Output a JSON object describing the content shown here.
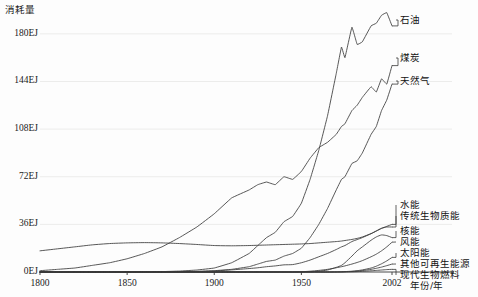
{
  "chart_data": {
    "type": "line",
    "title": "",
    "ylabel": "消耗量",
    "xlabel": "年份/年",
    "x_unit_note": "年份/年",
    "grid": true,
    "grid_axis": "y",
    "legend_position": "right-inline-leader-lines",
    "xlim": [
      1800,
      2002
    ],
    "ylim": [
      0,
      198
    ],
    "yticks": [
      0,
      36,
      72,
      108,
      144,
      180
    ],
    "ytick_labels": [
      "0EJ",
      "36EJ",
      "72EJ",
      "108EJ",
      "144EJ",
      "180EJ"
    ],
    "xticks": [
      1800,
      1850,
      1900,
      1950,
      2002
    ],
    "xtick_labels": [
      "1800",
      "1850",
      "1900",
      "1950",
      "2002"
    ],
    "x": [
      1800,
      1810,
      1820,
      1830,
      1840,
      1850,
      1860,
      1870,
      1880,
      1890,
      1900,
      1910,
      1920,
      1925,
      1930,
      1935,
      1940,
      1945,
      1950,
      1955,
      1960,
      1965,
      1970,
      1973,
      1975,
      1979,
      1982,
      1985,
      1990,
      1993,
      1996,
      1999,
      2002
    ],
    "series": [
      {
        "name": "石油",
        "name_en": "oil",
        "label_anchor_year": 2002,
        "label_anchor_value": 186,
        "values": [
          0,
          0,
          0,
          0,
          0,
          0,
          0.1,
          0.3,
          0.7,
          1.5,
          3,
          7,
          14,
          20,
          26,
          30,
          38,
          42,
          52,
          70,
          92,
          118,
          150,
          170,
          162,
          185,
          172,
          174,
          186,
          188,
          194,
          196,
          186
        ]
      },
      {
        "name": "煤炭",
        "name_en": "coal",
        "label_anchor_year": 2002,
        "label_anchor_value": 156,
        "values": [
          1,
          2,
          3,
          5,
          7,
          10,
          14,
          19,
          26,
          34,
          44,
          56,
          62,
          66,
          68,
          66,
          72,
          70,
          76,
          86,
          94,
          98,
          104,
          110,
          112,
          122,
          126,
          132,
          140,
          136,
          146,
          142,
          156
        ]
      },
      {
        "name": "天然气",
        "name_en": "natural gas",
        "label_anchor_year": 2002,
        "label_anchor_value": 142,
        "values": [
          0,
          0,
          0,
          0,
          0,
          0,
          0,
          0,
          0.2,
          0.5,
          1,
          2,
          4,
          6,
          8,
          9,
          12,
          14,
          18,
          26,
          36,
          48,
          62,
          70,
          72,
          82,
          84,
          90,
          104,
          110,
          122,
          130,
          142
        ]
      },
      {
        "name": "水能",
        "name_en": "hydropower",
        "label_anchor_year": 2002,
        "label_anchor_value": 36,
        "values": [
          0,
          0,
          0,
          0,
          0,
          0,
          0,
          0,
          0.1,
          0.3,
          0.8,
          1.6,
          2.6,
          3.2,
          4,
          4.6,
          5.4,
          5.6,
          7,
          9,
          11.5,
          14,
          17,
          19,
          20,
          23,
          24.5,
          26,
          29,
          31,
          33,
          34.5,
          36
        ]
      },
      {
        "name": "传统生物质能",
        "name_en": "traditional biomass",
        "label_anchor_year": 2002,
        "label_anchor_value": 34,
        "values": [
          16,
          17.5,
          19,
          20.5,
          21.5,
          22,
          22.2,
          22,
          21.5,
          20.8,
          20,
          19.8,
          20,
          20.2,
          20.4,
          20.6,
          20.8,
          21,
          21.2,
          21.5,
          22,
          22.5,
          23,
          23.4,
          23.8,
          24.6,
          25.4,
          26.5,
          29,
          31,
          33,
          34,
          34
        ]
      },
      {
        "name": "核能",
        "name_en": "nuclear",
        "label_anchor_year": 2002,
        "label_anchor_value": 26,
        "values": [
          0,
          0,
          0,
          0,
          0,
          0,
          0,
          0,
          0,
          0,
          0,
          0,
          0,
          0,
          0,
          0,
          0,
          0,
          0,
          0.2,
          0.6,
          1.5,
          3.5,
          5,
          7,
          12,
          16,
          19,
          24,
          26.5,
          28,
          27.5,
          26
        ]
      },
      {
        "name": "风能",
        "name_en": "wind",
        "label_anchor_year": 2002,
        "label_anchor_value": 22.5,
        "values": [
          0,
          0,
          0,
          0,
          0,
          0,
          0,
          0,
          0,
          0,
          0,
          0,
          0,
          0,
          0,
          0,
          0,
          0,
          0.2,
          0.6,
          1.2,
          2,
          3.2,
          4,
          4.6,
          6,
          7.2,
          8.6,
          11.5,
          13.5,
          16,
          19,
          22.5
        ]
      },
      {
        "name": "太阳能",
        "name_en": "solar",
        "label_anchor_year": 2002,
        "label_anchor_value": 11,
        "values": [
          0,
          0,
          0,
          0,
          0,
          0,
          0,
          0,
          0,
          0,
          0,
          0,
          0,
          0,
          0,
          0,
          0,
          0,
          0,
          0,
          0,
          0,
          0.1,
          0.2,
          0.3,
          0.6,
          1,
          1.6,
          3,
          4.4,
          6.2,
          8.4,
          11
        ]
      },
      {
        "name": "其他可再生能源",
        "name_en": "other renewables",
        "label_anchor_year": 2002,
        "label_anchor_value": 6,
        "values": [
          0,
          0,
          0,
          0,
          0,
          0,
          0,
          0,
          0,
          0,
          0,
          0,
          0,
          0,
          0,
          0,
          0,
          0,
          0,
          0,
          0,
          0,
          0,
          0.1,
          0.2,
          0.4,
          0.7,
          1.1,
          2,
          2.8,
          3.7,
          4.8,
          6
        ]
      },
      {
        "name": "现代生物燃料",
        "name_en": "modern biofuels",
        "label_anchor_year": 2002,
        "label_anchor_value": 2,
        "values": [
          0,
          0,
          0,
          0,
          0,
          0,
          0,
          0,
          0,
          0,
          0,
          0,
          0,
          0,
          0,
          0,
          0,
          0,
          0,
          0,
          0,
          0,
          0,
          0,
          0.05,
          0.15,
          0.3,
          0.5,
          0.9,
          1.2,
          1.5,
          1.8,
          2
        ]
      }
    ],
    "colors": {
      "line": "#3a3a3a",
      "grid": "#ececeb",
      "axis": "#4a4a4a",
      "text": "#1a1a1a",
      "background": "#fdfdfd"
    }
  }
}
